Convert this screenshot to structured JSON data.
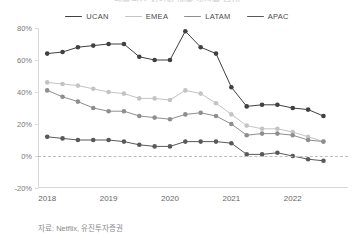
{
  "chart_data": {
    "type": "line",
    "title": "넷플릭스 지역별 매출 성장률 추이",
    "source_note": "자료: Netflix, 유진투자증권",
    "xlabel": "",
    "ylabel": "",
    "ylim": [
      -20,
      80
    ],
    "ytick_labels": [
      "80%",
      "60%",
      "40%",
      "20%",
      "0%",
      "-20%"
    ],
    "ytick_values": [
      80,
      60,
      40,
      20,
      0,
      -20
    ],
    "xtick_labels": [
      "2018",
      "2019",
      "2020",
      "2021",
      "2022"
    ],
    "xtick_values": [
      2018.0,
      2019.0,
      2020.0,
      2021.0,
      2022.0
    ],
    "xlim": [
      2017.85,
      2022.9
    ],
    "grid": false,
    "legend_position": "top-center",
    "zero_line": true,
    "markers": true,
    "x": [
      2018.0,
      2018.25,
      2018.5,
      2018.75,
      2019.0,
      2019.25,
      2019.5,
      2019.75,
      2020.0,
      2020.25,
      2020.5,
      2020.75,
      2021.0,
      2021.25,
      2021.5,
      2021.75,
      2022.0,
      2022.25,
      2022.5
    ],
    "series": [
      {
        "name": "UCAN",
        "color": "#404040",
        "values": [
          64,
          65,
          68,
          69,
          70,
          70,
          62,
          60,
          60,
          78,
          68,
          64,
          43,
          31,
          32,
          32,
          30,
          29,
          25
        ]
      },
      {
        "name": "EMEA",
        "color": "#c4c4c4",
        "values": [
          46,
          45,
          44,
          42,
          40,
          39,
          36,
          36,
          35,
          41,
          39,
          33,
          26,
          19,
          17,
          17,
          15,
          12,
          9
        ]
      },
      {
        "name": "LATAM",
        "color": "#8e8e8e",
        "values": [
          41,
          37,
          34,
          30,
          28,
          28,
          25,
          24,
          23,
          26,
          27,
          25,
          20,
          13,
          14,
          14,
          13,
          10,
          9
        ]
      },
      {
        "name": "APAC",
        "color": "#595959",
        "values": [
          12,
          11,
          10,
          10,
          10,
          9,
          7,
          6,
          6,
          9,
          9,
          9,
          8,
          1,
          1,
          2,
          0,
          -2,
          -3
        ]
      }
    ]
  }
}
